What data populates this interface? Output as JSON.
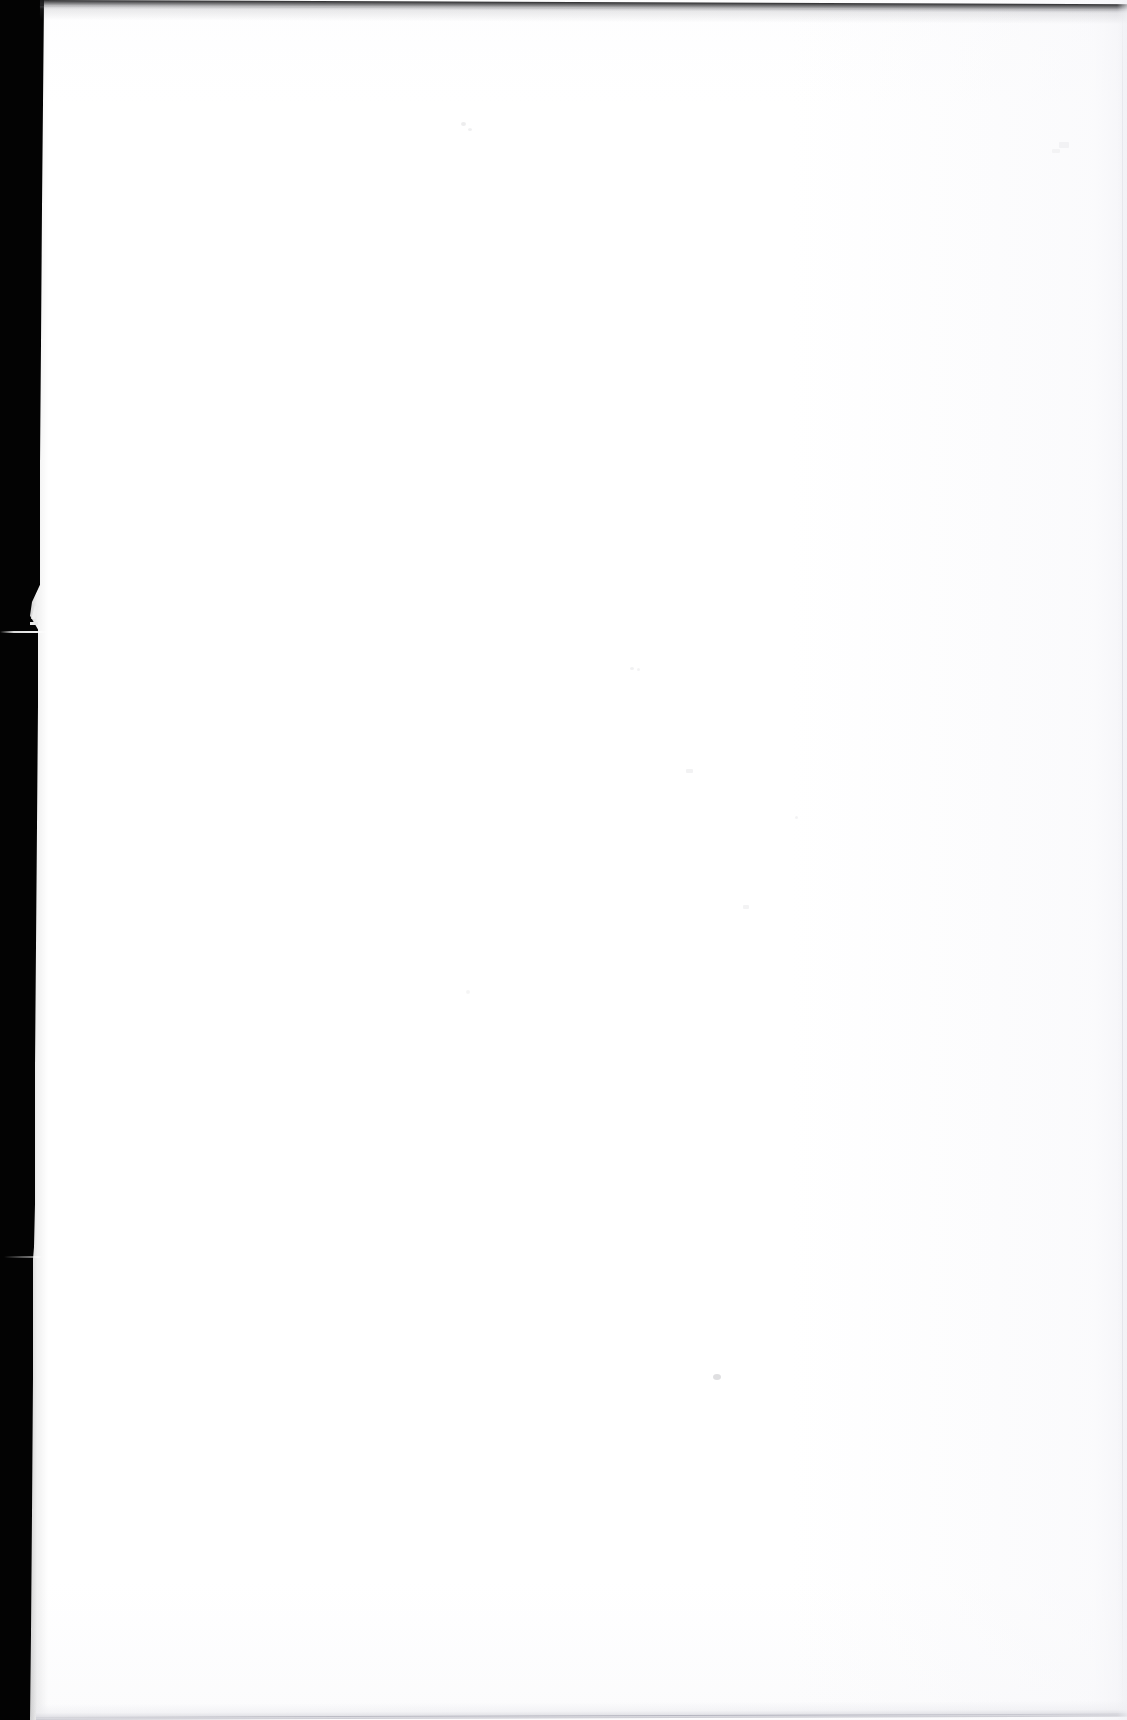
{
  "document": {
    "kind": "scanned-page",
    "page_label": "",
    "body_text": "",
    "page_width": 1127,
    "page_height": 1720,
    "paper_color": "#ffffff",
    "description": "Blank scanned document page"
  },
  "scan_artifacts": {
    "left_band": {
      "name": "scanner-bed-black-border",
      "color": "#030303",
      "width_top": 44,
      "width_bottom": 30
    },
    "notch": {
      "name": "torn-edge-notch",
      "y": 600,
      "height": 45
    },
    "top_edge": {
      "name": "page-top-dark-edge",
      "color": "#1a1a1c"
    },
    "bottom_edge": {
      "name": "page-bottom-gray-edge",
      "color": "#c6c6ce"
    },
    "right_edge": {
      "name": "page-right-faint-line",
      "color": "#d0d0da"
    },
    "specks": [
      {
        "x": 461,
        "y": 122,
        "w": 5,
        "h": 4,
        "opacity": 0.16
      },
      {
        "x": 468,
        "y": 128,
        "w": 4,
        "h": 3,
        "opacity": 0.13
      },
      {
        "x": 630,
        "y": 667,
        "w": 4,
        "h": 3,
        "opacity": 0.12
      },
      {
        "x": 637,
        "y": 668,
        "w": 3,
        "h": 3,
        "opacity": 0.1
      },
      {
        "x": 686,
        "y": 769,
        "w": 7,
        "h": 4,
        "opacity": 0.11
      },
      {
        "x": 795,
        "y": 816,
        "w": 3,
        "h": 3,
        "opacity": 0.1
      },
      {
        "x": 743,
        "y": 905,
        "w": 6,
        "h": 4,
        "opacity": 0.1
      },
      {
        "x": 713,
        "y": 1374,
        "w": 8,
        "h": 6,
        "opacity": 0.28
      },
      {
        "x": 466,
        "y": 990,
        "w": 4,
        "h": 4,
        "opacity": 0.09
      },
      {
        "x": 1059,
        "y": 142,
        "w": 10,
        "h": 6,
        "opacity": 0.08
      },
      {
        "x": 1052,
        "y": 149,
        "w": 8,
        "h": 4,
        "opacity": 0.07
      }
    ]
  }
}
